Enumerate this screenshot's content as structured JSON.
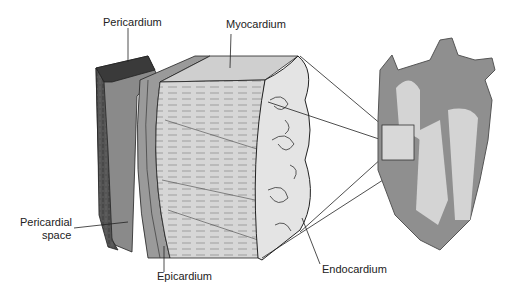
{
  "diagram": {
    "labels": {
      "pericardium": "Pericardium",
      "myocardium": "Myocardium",
      "pericardial_space_line1": "Pericardial",
      "pericardial_space_line2": "space",
      "epicardium": "Epicardium",
      "endocardium": "Endocardium"
    },
    "colors": {
      "background": "#ffffff",
      "pericardium_dark": "#4a4a4a",
      "pericardium_mid": "#8a8a8a",
      "muscle_light": "#d8d8d8",
      "endocardium_fill": "#e6e6e6",
      "heart_gray": "#8f8f8f",
      "chamber_light": "#d4d4d4",
      "line": "#222222"
    }
  }
}
